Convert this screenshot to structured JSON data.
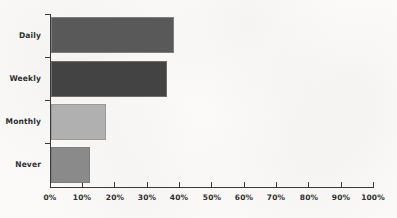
{
  "chart_data": {
    "type": "bar",
    "orientation": "horizontal",
    "title": "",
    "xlabel": "",
    "ylabel": "",
    "categories": [
      "Daily",
      "Weekly",
      "Monthly",
      "Never"
    ],
    "values": [
      38,
      36,
      17,
      12
    ],
    "value_suffix": "%",
    "xlim": [
      0,
      100
    ],
    "xticks": [
      0,
      10,
      20,
      30,
      40,
      50,
      60,
      70,
      80,
      90,
      100
    ],
    "xtick_labels": [
      "0%",
      "10%",
      "20%",
      "30%",
      "40%",
      "50%",
      "60%",
      "70%",
      "80%",
      "90%",
      "100%"
    ],
    "grid": false,
    "legend": "none",
    "bar_colors": [
      "#595959",
      "#434343",
      "#b0b0b0",
      "#8a8a8a"
    ],
    "bar_border_color": "#7d7d7d",
    "axis_color": "#3a3a3a",
    "background_color": "#fbfaf9",
    "series": [
      {
        "name": "Response share",
        "points": [
          {
            "category": "Daily",
            "value": 38,
            "label": "38%",
            "color": "#595959"
          },
          {
            "category": "Weekly",
            "value": 36,
            "label": "36%",
            "color": "#434343"
          },
          {
            "category": "Monthly",
            "value": 17,
            "label": "17%",
            "color": "#b0b0b0"
          },
          {
            "category": "Never",
            "value": 12,
            "label": "12%",
            "color": "#8a8a8a"
          }
        ]
      }
    ]
  }
}
